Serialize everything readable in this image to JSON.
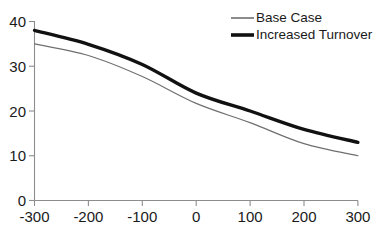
{
  "chart_data": {
    "type": "line",
    "title": "",
    "title_note": "title is cropped off the top edge of the screenshot",
    "xlabel": "",
    "ylabel": "",
    "x": [
      -300,
      -200,
      -100,
      0,
      100,
      200,
      300
    ],
    "xticklabels": [
      "-300",
      "-200",
      "-100",
      "0",
      "100",
      "200",
      "300"
    ],
    "yticks": [
      0,
      10,
      20,
      30,
      40
    ],
    "yticklabels": [
      "0",
      "10",
      "20",
      "30",
      "40"
    ],
    "xlim": [
      -300,
      300
    ],
    "ylim": [
      0,
      40
    ],
    "grid": false,
    "legend_position": "top-right",
    "series": [
      {
        "name": "Base Case",
        "style": "thin",
        "color": "#6f6f6f",
        "values": [
          35.0,
          32.4,
          27.7,
          21.7,
          17.4,
          12.7,
          10.0
        ]
      },
      {
        "name": "Increased Turnover",
        "style": "thick",
        "color": "#111111",
        "values": [
          38.0,
          34.9,
          30.4,
          24.0,
          20.0,
          15.9,
          13.0
        ]
      }
    ]
  },
  "legend": {
    "items": [
      {
        "label": "Base Case"
      },
      {
        "label": "Increased Turnover"
      }
    ]
  },
  "colors": {
    "background": "#ffffff",
    "axis": "#8d8d8d",
    "text": "#1a1a1a",
    "series_base_case": "#6f6f6f",
    "series_increased_turnover": "#111111"
  }
}
